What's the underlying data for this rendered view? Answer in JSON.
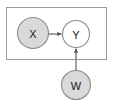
{
  "figure": {
    "type": "causal-graphical-model",
    "title": "",
    "background_color": "#ffffff",
    "stroke_color": "#8c8c8c",
    "edge_color": "#7a7a7a",
    "shaded_fill": "#d9d9d9",
    "unshaded_fill": "#ffffff",
    "label_color": "#1a1a1a"
  },
  "plate": {
    "name": "plate",
    "label": "",
    "x": 6,
    "y": 7,
    "width": 101,
    "height": 53,
    "fill": "#ffffff",
    "stroke": "#9a9a9a"
  },
  "nodes": [
    {
      "id": "X",
      "label": "X",
      "cx": 33,
      "cy": 33,
      "r": 16,
      "shaded": true,
      "fill": "#d9d9d9",
      "stroke": "#8c8c8c",
      "inside_plate": true
    },
    {
      "id": "Y",
      "label": "Y",
      "cx": 76,
      "cy": 34,
      "r": 14,
      "shaded": false,
      "fill": "#ffffff",
      "stroke": "#8c8c8c",
      "inside_plate": true
    },
    {
      "id": "W",
      "label": "W",
      "cx": 76,
      "cy": 85,
      "r": 15,
      "shaded": true,
      "fill": "#d9d9d9",
      "stroke": "#8c8c8c",
      "inside_plate": false
    }
  ],
  "edges": [
    {
      "id": "X-to-Y",
      "from": "X",
      "to": "Y",
      "direction": "right",
      "x1": 49,
      "y1": 34,
      "x2": 62,
      "y2": 34,
      "color": "#7a7a7a"
    },
    {
      "id": "W-to-Y",
      "from": "W",
      "to": "Y",
      "direction": "up",
      "x1": 76,
      "y1": 70,
      "x2": 76,
      "y2": 48,
      "color": "#7a7a7a"
    }
  ]
}
